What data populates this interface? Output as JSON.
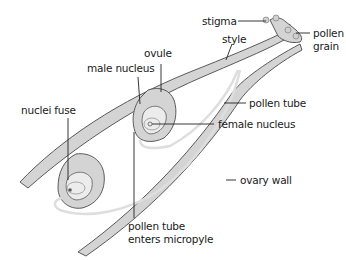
{
  "diagram": {
    "colors": {
      "tissue_fill": "#d4d4d4",
      "outline": "#5a5a5a",
      "pollen_tube": "#e2e2e2",
      "leader_line": "#222222",
      "text": "#1a1a1a"
    },
    "labels": {
      "stigma": "stigma",
      "style": "style",
      "pollen_grain_1": "pollen",
      "pollen_grain_2": "grain",
      "ovule": "ovule",
      "male_nucleus": "male nucleus",
      "nuclei_fuse": "nuclei fuse",
      "pollen_tube": "pollen tube",
      "female_nucleus": "female nucleus",
      "ovary_wall": "ovary wall",
      "pollen_tube_enters_1": "pollen tube",
      "pollen_tube_enters_2": "enters micropyle"
    }
  }
}
